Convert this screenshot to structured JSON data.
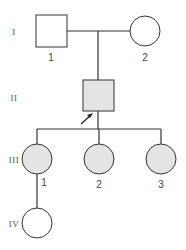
{
  "diagram": {
    "type": "pedigree",
    "colors": {
      "line": "#333333",
      "affected_fill": "#e4e4e4",
      "unaffected_fill": "#ffffff"
    },
    "generations": [
      {
        "label": "I"
      },
      {
        "label": "II"
      },
      {
        "label": "III"
      },
      {
        "label": "IV"
      }
    ],
    "individuals": {
      "I_1": {
        "label": "1",
        "sex": "male",
        "affected": false
      },
      "I_2": {
        "label": "2",
        "sex": "female",
        "affected": false
      },
      "II_1": {
        "label": "",
        "sex": "male",
        "affected": true,
        "proband": true
      },
      "III_1": {
        "label": "1",
        "sex": "female",
        "affected": true
      },
      "III_2": {
        "label": "2",
        "sex": "female",
        "affected": true
      },
      "III_3": {
        "label": "3",
        "sex": "female",
        "affected": true
      },
      "IV_1": {
        "label": "",
        "sex": "female",
        "affected": false
      }
    }
  }
}
